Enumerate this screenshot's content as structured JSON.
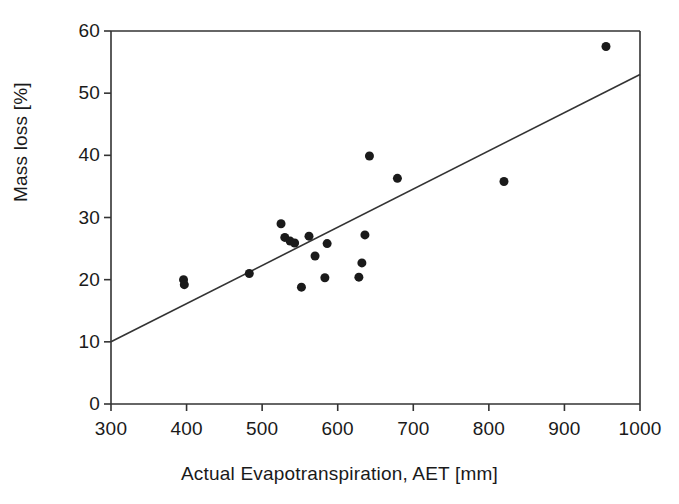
{
  "chart_data": {
    "type": "scatter",
    "title": "",
    "xlabel": "Actual Evapotranspiration, AET [mm]",
    "ylabel": "Mass loss [%]",
    "xlim": [
      300,
      1000
    ],
    "ylim": [
      0,
      60
    ],
    "xticks": [
      300,
      400,
      500,
      600,
      700,
      800,
      900,
      1000
    ],
    "yticks": [
      0,
      10,
      20,
      30,
      40,
      50,
      60
    ],
    "xtick_labels": [
      "300",
      "400",
      "500",
      "600",
      "700",
      "800",
      "900",
      "1000"
    ],
    "ytick_labels": [
      "0",
      "10",
      "20",
      "30",
      "40",
      "50",
      "60"
    ],
    "grid": false,
    "legend": null,
    "marker": {
      "shape": "circle",
      "color": "#1a1a1a",
      "size": 9
    },
    "points": [
      {
        "x": 396,
        "y": 20.0
      },
      {
        "x": 397,
        "y": 19.2
      },
      {
        "x": 483,
        "y": 21.0
      },
      {
        "x": 525,
        "y": 29.0
      },
      {
        "x": 530,
        "y": 26.8
      },
      {
        "x": 537,
        "y": 26.2
      },
      {
        "x": 543,
        "y": 25.9
      },
      {
        "x": 552,
        "y": 18.8
      },
      {
        "x": 562,
        "y": 27.0
      },
      {
        "x": 570,
        "y": 23.8
      },
      {
        "x": 583,
        "y": 20.3
      },
      {
        "x": 586,
        "y": 25.8
      },
      {
        "x": 628,
        "y": 20.4
      },
      {
        "x": 632,
        "y": 22.7
      },
      {
        "x": 636,
        "y": 27.2
      },
      {
        "x": 642,
        "y": 39.9
      },
      {
        "x": 679,
        "y": 36.3
      },
      {
        "x": 820,
        "y": 35.8
      },
      {
        "x": 955,
        "y": 57.5
      }
    ],
    "trendline": {
      "type": "linear",
      "x_start": 300,
      "y_start": 10.0,
      "x_end": 1000,
      "y_end": 53.0,
      "color": "#333333"
    }
  }
}
